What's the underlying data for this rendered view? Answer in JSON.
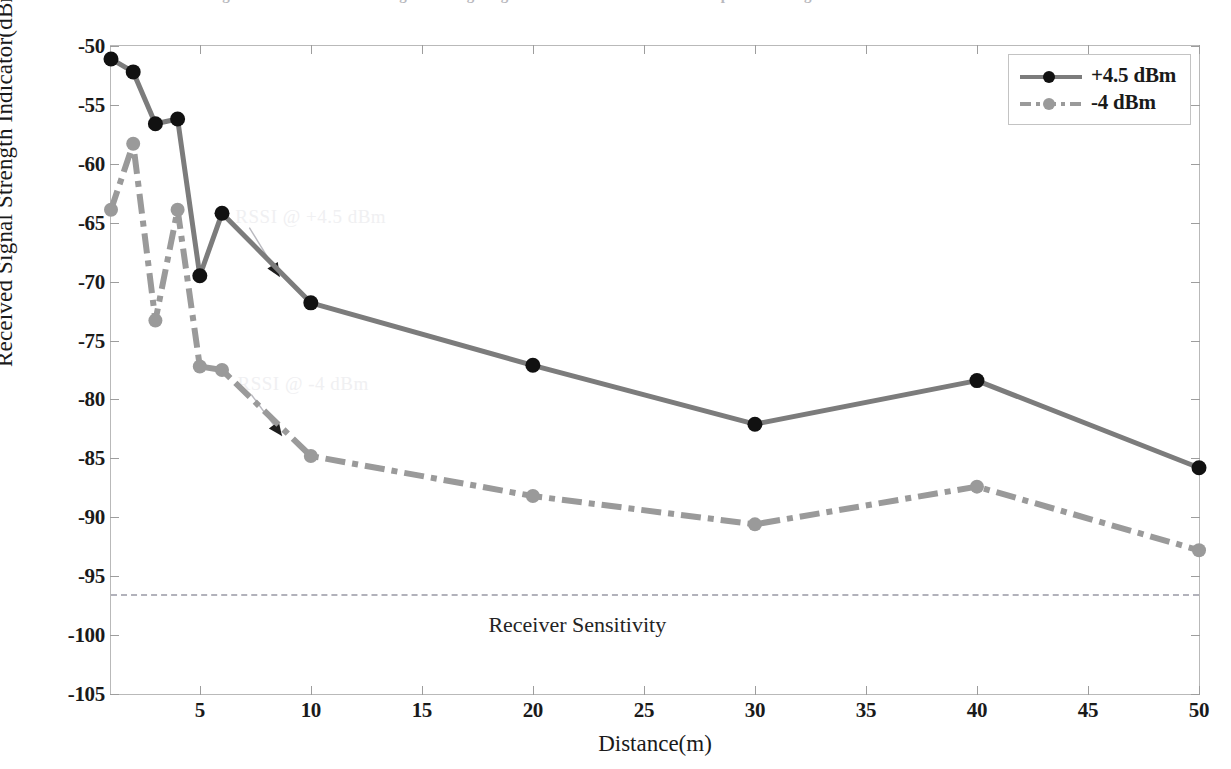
{
  "figure": {
    "top_clipped_text": "Figure  Measured received signal strength against distance for two transmit power settings",
    "background": "#ffffff"
  },
  "legend": {
    "position": "top-right",
    "entries": [
      {
        "label": "+4.5 dBm",
        "color": "#7c7c7c",
        "marker_color": "#111111",
        "style": "solid"
      },
      {
        "label": "-4 dBm",
        "color": "#9a9a9a",
        "marker_color": "#9a9a9a",
        "style": "dashdot"
      }
    ]
  },
  "annotations": [
    {
      "text": "RSSI @ +4.5 dBm",
      "x": 6.6,
      "y": -64.4,
      "arrow_to_x": 8.6,
      "arrow_to_y": -69.6
    },
    {
      "text": "RSSI @ -4 dBm",
      "x": 6.7,
      "y": -78.6,
      "arrow_to_x": 8.7,
      "arrow_to_y": -83.1
    }
  ],
  "sensitivity": {
    "label": "Receiver Sensitivity",
    "value": -96.5,
    "label_x": 22.0,
    "color": "#b2b2bb"
  },
  "chart_data": {
    "type": "line",
    "title": "",
    "xlabel": "Distance(m)",
    "ylabel": "Received Signal Strength Indicator(dBm)",
    "xlim": [
      1,
      50
    ],
    "ylim": [
      -105,
      -50
    ],
    "xticks": [
      5,
      10,
      15,
      20,
      25,
      30,
      35,
      40,
      45,
      50
    ],
    "yticks": [
      -105,
      -100,
      -95,
      -90,
      -85,
      -80,
      -75,
      -70,
      -65,
      -60,
      -55,
      -50
    ],
    "grid": false,
    "legend_position": "upper right",
    "x": [
      1,
      2,
      3,
      4,
      5,
      6,
      10,
      20,
      30,
      40,
      50
    ],
    "series": [
      {
        "name": "+4.5 dBm",
        "color": "#7c7c7c",
        "marker_color": "#111111",
        "style": "solid",
        "values": [
          -51.1,
          -52.2,
          -56.6,
          -56.2,
          -69.5,
          -64.2,
          -71.8,
          -77.1,
          -82.1,
          -78.4,
          -85.8
        ]
      },
      {
        "name": "-4 dBm",
        "color": "#9a9a9a",
        "marker_color": "#9a9a9a",
        "style": "dashdot",
        "values": [
          -63.9,
          -58.3,
          -73.3,
          -63.9,
          -77.2,
          -77.5,
          -84.8,
          -88.2,
          -90.6,
          -87.4,
          -92.8
        ]
      }
    ]
  }
}
